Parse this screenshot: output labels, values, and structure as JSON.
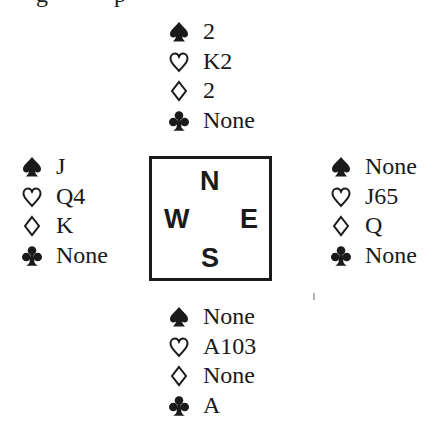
{
  "diagram": {
    "type": "bridge-deal",
    "suit_icons": {
      "spades": "spade-icon (filled)",
      "hearts": "heart-icon (outline)",
      "diamonds": "diamond-icon (outline)",
      "clubs": "club-icon (filled)"
    },
    "compass": {
      "north": "N",
      "west": "W",
      "east": "E",
      "south": "S"
    },
    "hands": {
      "north": {
        "spades": "2",
        "hearts": "K2",
        "diamonds": "2",
        "clubs": "None"
      },
      "west": {
        "spades": "J",
        "hearts": "Q4",
        "diamonds": "K",
        "clubs": "None"
      },
      "east": {
        "spades": "None",
        "hearts": "J65",
        "diamonds": "Q",
        "clubs": "None"
      },
      "south": {
        "spades": "None",
        "hearts": "A103",
        "diamonds": "None",
        "clubs": "A"
      }
    }
  },
  "colors": {
    "ink": "#1a1a1a",
    "background": "#ffffff"
  }
}
